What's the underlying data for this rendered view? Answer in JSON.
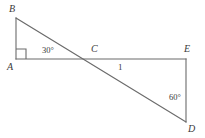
{
  "figure": {
    "type": "geometry-diagram",
    "width": 205,
    "height": 138,
    "background_color": "#ffffff",
    "stroke_color": "#6b6b6b",
    "text_color": "#3a3a3a",
    "vertices": [
      {
        "name": "B",
        "label": "B",
        "x": 16,
        "y": 18,
        "label_x": 9,
        "label_y": 4
      },
      {
        "name": "A",
        "label": "A",
        "x": 16,
        "y": 59,
        "label_x": 7,
        "label_y": 62
      },
      {
        "name": "C",
        "label": "C",
        "x": 95,
        "y": 59,
        "label_x": 91,
        "label_y": 44
      },
      {
        "name": "E",
        "label": "E",
        "x": 186,
        "y": 59,
        "label_x": 184,
        "label_y": 44
      },
      {
        "name": "D",
        "label": "D",
        "x": 186,
        "y": 122,
        "label_x": 188,
        "label_y": 124
      }
    ],
    "segments": [
      {
        "name": "segment-AB",
        "x1": 16,
        "y1": 59,
        "x2": 16,
        "y2": 18
      },
      {
        "name": "segment-AE",
        "x1": 16,
        "y1": 59,
        "x2": 186,
        "y2": 59
      },
      {
        "name": "segment-BD",
        "x1": 16,
        "y1": 18,
        "x2": 186,
        "y2": 122
      },
      {
        "name": "segment-ED",
        "x1": 186,
        "y1": 59,
        "x2": 186,
        "y2": 122
      }
    ],
    "right_angle_marker": {
      "name": "right-angle-at-A",
      "at_vertex": "A",
      "points": "16,49 26,49 26,59"
    },
    "angle_labels": [
      {
        "name": "angle-30-at-C",
        "text": "30°",
        "x": 42,
        "y": 46
      },
      {
        "name": "angle-60-at-D",
        "text": "60°",
        "x": 169,
        "y": 93
      }
    ],
    "length_labels": [
      {
        "name": "length-CE",
        "text": "1",
        "x": 118,
        "y": 63
      }
    ]
  }
}
